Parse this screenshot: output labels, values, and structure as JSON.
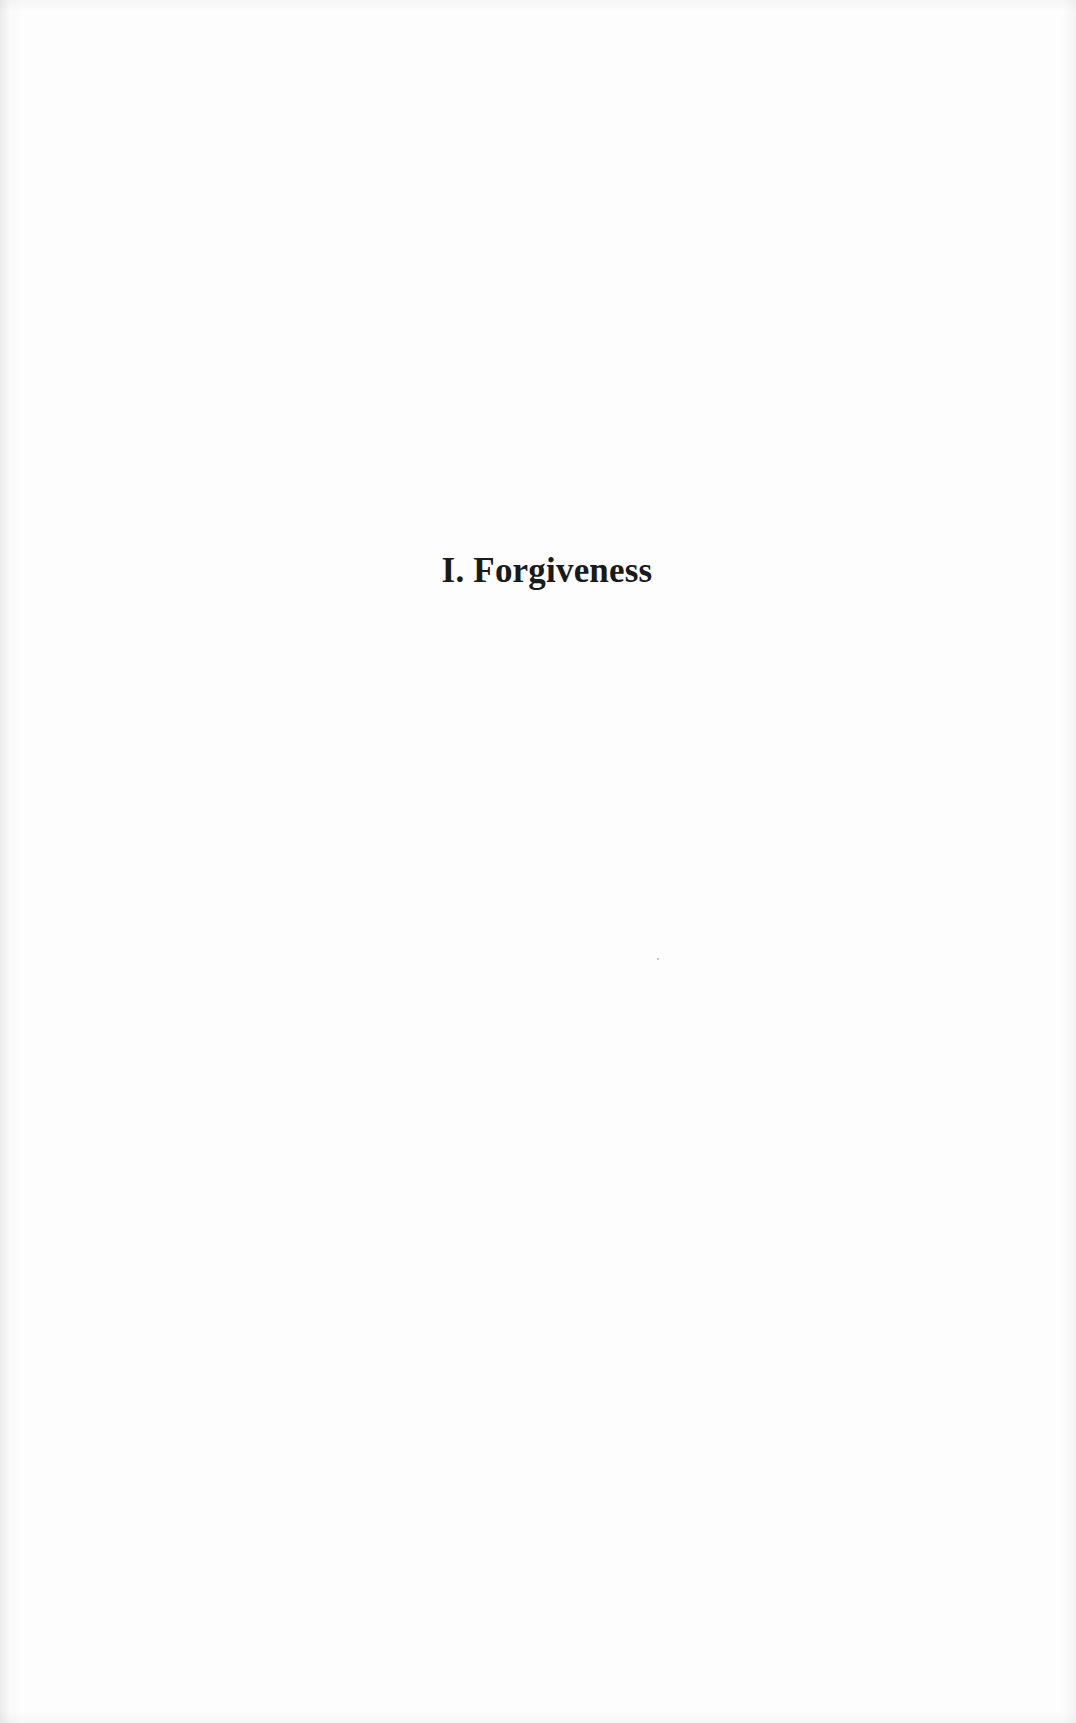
{
  "page": {
    "type": "part-title-page",
    "title": "I. Forgiveness",
    "colors": {
      "background": "#fdfdfd",
      "text": "#1a1a1a"
    }
  }
}
